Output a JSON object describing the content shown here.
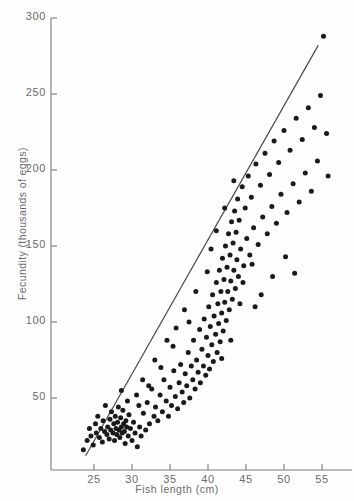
{
  "figure": {
    "caption_fragment": ""
  },
  "axes": {
    "x_title": "Fish length (cm)",
    "y_title": "Fecundity (thousands of eggs)",
    "x_ticks": [
      "25",
      "30",
      "35",
      "40",
      "45",
      "50",
      "55"
    ],
    "y_ticks": [
      "50",
      "100",
      "150",
      "200",
      "250",
      "300"
    ]
  },
  "chart_data": {
    "type": "scatter",
    "title": "",
    "xlabel": "Fish length (cm)",
    "ylabel": "Fecundity (thousands of eggs)",
    "xlim": [
      22,
      57
    ],
    "ylim": [
      0,
      300
    ],
    "xticks": [
      25,
      30,
      35,
      40,
      45,
      50,
      55
    ],
    "yticks": [
      50,
      100,
      150,
      200,
      250,
      300
    ],
    "grid": false,
    "legend": null,
    "marker": {
      "shape": "circle",
      "color": "#1a1a1a",
      "size_px": 5
    },
    "fit_line": {
      "name": "fitted regression line",
      "color": "#4a4a4a",
      "x": [
        23.9,
        54.5
      ],
      "y": [
        12,
        282
      ]
    },
    "series": [
      {
        "name": "fish",
        "n_points": 188,
        "points": [
          [
            23.6,
            16
          ],
          [
            24.1,
            22
          ],
          [
            24.4,
            30
          ],
          [
            24.6,
            25
          ],
          [
            24.9,
            19
          ],
          [
            25.2,
            33
          ],
          [
            25.3,
            27
          ],
          [
            25.5,
            38
          ],
          [
            25.7,
            24
          ],
          [
            25.9,
            30
          ],
          [
            26.1,
            21
          ],
          [
            26.2,
            35
          ],
          [
            26.4,
            28
          ],
          [
            26.5,
            45
          ],
          [
            26.7,
            26
          ],
          [
            26.8,
            31
          ],
          [
            27.0,
            23
          ],
          [
            27.1,
            36
          ],
          [
            27.2,
            29
          ],
          [
            27.3,
            41
          ],
          [
            27.5,
            27
          ],
          [
            27.6,
            33
          ],
          [
            27.7,
            22
          ],
          [
            27.8,
            38
          ],
          [
            27.9,
            30
          ],
          [
            28.0,
            26
          ],
          [
            28.1,
            34
          ],
          [
            28.2,
            44
          ],
          [
            28.3,
            29
          ],
          [
            28.4,
            24
          ],
          [
            28.5,
            37
          ],
          [
            28.6,
            31
          ],
          [
            28.7,
            27
          ],
          [
            28.8,
            42
          ],
          [
            28.9,
            33
          ],
          [
            29.0,
            28
          ],
          [
            29.1,
            20
          ],
          [
            29.2,
            35
          ],
          [
            29.3,
            31
          ],
          [
            29.5,
            25
          ],
          [
            29.6,
            39
          ],
          [
            29.8,
            30
          ],
          [
            30.0,
            22
          ],
          [
            30.2,
            34
          ],
          [
            30.4,
            27
          ],
          [
            30.7,
            18
          ],
          [
            31.0,
            31
          ],
          [
            31.2,
            25
          ],
          [
            31.5,
            40
          ],
          [
            31.8,
            29
          ],
          [
            32.0,
            47
          ],
          [
            32.3,
            33
          ],
          [
            32.6,
            56
          ],
          [
            32.9,
            38
          ],
          [
            33.1,
            44
          ],
          [
            33.4,
            35
          ],
          [
            33.7,
            52
          ],
          [
            34.0,
            41
          ],
          [
            34.2,
            62
          ],
          [
            34.5,
            48
          ],
          [
            34.8,
            38
          ],
          [
            35.0,
            57
          ],
          [
            35.2,
            45
          ],
          [
            35.5,
            68
          ],
          [
            35.7,
            51
          ],
          [
            36.0,
            43
          ],
          [
            36.2,
            60
          ],
          [
            36.4,
            72
          ],
          [
            36.6,
            54
          ],
          [
            36.8,
            47
          ],
          [
            37.0,
            66
          ],
          [
            37.2,
            58
          ],
          [
            37.4,
            80
          ],
          [
            37.6,
            50
          ],
          [
            37.8,
            71
          ],
          [
            38.0,
            62
          ],
          [
            38.1,
            88
          ],
          [
            38.3,
            56
          ],
          [
            38.5,
            75
          ],
          [
            38.7,
            67
          ],
          [
            38.9,
            95
          ],
          [
            39.0,
            60
          ],
          [
            39.2,
            82
          ],
          [
            39.4,
            71
          ],
          [
            39.5,
            102
          ],
          [
            39.7,
            65
          ],
          [
            39.8,
            90
          ],
          [
            40.0,
            78
          ],
          [
            40.1,
            110
          ],
          [
            40.2,
            69
          ],
          [
            40.3,
            97
          ],
          [
            40.5,
            85
          ],
          [
            40.6,
            118
          ],
          [
            40.7,
            74
          ],
          [
            40.8,
            104
          ],
          [
            41.0,
            92
          ],
          [
            41.1,
            126
          ],
          [
            41.2,
            80
          ],
          [
            41.3,
            112
          ],
          [
            41.4,
            99
          ],
          [
            41.5,
            134
          ],
          [
            41.6,
            87
          ],
          [
            41.7,
            120
          ],
          [
            41.8,
            106
          ],
          [
            41.9,
            142
          ],
          [
            42.0,
            94
          ],
          [
            42.1,
            128
          ],
          [
            42.2,
            113
          ],
          [
            42.3,
            150
          ],
          [
            42.4,
            101
          ],
          [
            42.5,
            136
          ],
          [
            42.6,
            120
          ],
          [
            42.7,
            158
          ],
          [
            42.8,
            108
          ],
          [
            42.9,
            144
          ],
          [
            43.0,
            127
          ],
          [
            43.1,
            166
          ],
          [
            43.2,
            115
          ],
          [
            43.3,
            152
          ],
          [
            43.4,
            134
          ],
          [
            43.5,
            173
          ],
          [
            43.6,
            122
          ],
          [
            43.7,
            159
          ],
          [
            43.8,
            141
          ],
          [
            43.9,
            181
          ],
          [
            44.0,
            130
          ],
          [
            44.1,
            167
          ],
          [
            44.3,
            148
          ],
          [
            44.5,
            189
          ],
          [
            44.7,
            137
          ],
          [
            44.9,
            175
          ],
          [
            45.1,
            155
          ],
          [
            45.3,
            196
          ],
          [
            45.5,
            144
          ],
          [
            45.7,
            182
          ],
          [
            46.0,
            162
          ],
          [
            46.3,
            204
          ],
          [
            46.6,
            151
          ],
          [
            46.9,
            190
          ],
          [
            47.2,
            169
          ],
          [
            47.5,
            211
          ],
          [
            47.8,
            158
          ],
          [
            48.1,
            197
          ],
          [
            48.4,
            176
          ],
          [
            48.7,
            219
          ],
          [
            49.0,
            165
          ],
          [
            49.3,
            205
          ],
          [
            49.6,
            184
          ],
          [
            50.0,
            226
          ],
          [
            50.4,
            172
          ],
          [
            50.8,
            213
          ],
          [
            51.2,
            191
          ],
          [
            51.6,
            234
          ],
          [
            52.0,
            179
          ],
          [
            52.4,
            220
          ],
          [
            52.8,
            198
          ],
          [
            53.2,
            241
          ],
          [
            53.6,
            186
          ],
          [
            54.0,
            228
          ],
          [
            54.4,
            206
          ],
          [
            54.8,
            249
          ],
          [
            55.2,
            288
          ],
          [
            55.6,
            224
          ],
          [
            55.8,
            196
          ],
          [
            33.0,
            75
          ],
          [
            34.6,
            88
          ],
          [
            35.8,
            96
          ],
          [
            31.4,
            62
          ],
          [
            30.6,
            52
          ],
          [
            29.4,
            48
          ],
          [
            28.6,
            55
          ],
          [
            36.9,
            108
          ],
          [
            38.4,
            120
          ],
          [
            39.9,
            133
          ],
          [
            41.1,
            160
          ],
          [
            42.2,
            175
          ],
          [
            43.4,
            193
          ],
          [
            44.6,
            126
          ],
          [
            45.8,
            138
          ],
          [
            47.0,
            118
          ],
          [
            48.5,
            130
          ],
          [
            50.2,
            143
          ],
          [
            51.4,
            132
          ],
          [
            46.2,
            110
          ],
          [
            40.4,
            148
          ],
          [
            37.5,
            100
          ],
          [
            35.4,
            84
          ],
          [
            33.8,
            70
          ],
          [
            32.2,
            58
          ],
          [
            30.9,
            45
          ],
          [
            44.2,
            112
          ],
          [
            43.0,
            88
          ],
          [
            41.8,
            76
          ]
        ]
      }
    ]
  }
}
